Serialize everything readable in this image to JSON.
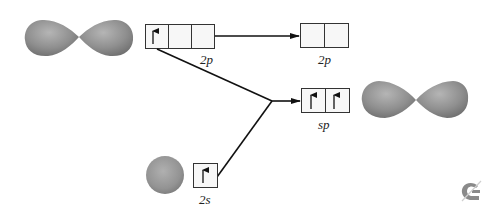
{
  "diagram": {
    "orbitals": {
      "left_p": {
        "shape": "p-orbital-dumbbell",
        "color": "#8f8f8f"
      },
      "sphere_s": {
        "shape": "s-orbital-sphere",
        "color": "#9a9a9a"
      },
      "right_sp": {
        "shape": "sp-orbital-dumbbell",
        "color": "#8f8f8f"
      }
    },
    "boxes": {
      "initial_2p": {
        "label": "2p",
        "cells": 3,
        "electrons": [
          "up",
          "",
          ""
        ]
      },
      "remaining_2p": {
        "label": "2p",
        "cells": 2,
        "electrons": [
          "",
          ""
        ]
      },
      "hybrid_sp": {
        "label": "sp",
        "cells": 2,
        "electrons": [
          "up",
          "up"
        ]
      },
      "initial_2s": {
        "label": "2s",
        "cells": 1,
        "electrons": [
          "up"
        ]
      }
    },
    "labels": {
      "initial_2p": "2p",
      "remaining_2p": "2p",
      "hybrid_sp": "sp",
      "initial_2s": "2s"
    },
    "connections": [
      {
        "from": "initial_2p",
        "to": "remaining_2p",
        "type": "arrow"
      },
      {
        "from": "initial_2p.cell0",
        "to": "junction",
        "type": "line"
      },
      {
        "from": "initial_2s",
        "to": "junction",
        "type": "line"
      },
      {
        "from": "junction",
        "to": "hybrid_sp",
        "type": "arrow"
      }
    ],
    "logo": {
      "name": "publisher-logo",
      "color": "#8a8a8a"
    }
  }
}
